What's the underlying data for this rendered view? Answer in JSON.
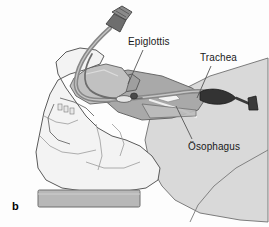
{
  "figure": {
    "panel_letter": "b",
    "type": "anatomical-illustration",
    "background_color": "#fdfdfd"
  },
  "labels": [
    {
      "id": "epiglottis",
      "text": "Epiglottis",
      "x": 128,
      "y": 36,
      "leader": {
        "x1": 143,
        "y1": 50,
        "x2": 128,
        "y2": 84
      }
    },
    {
      "id": "trachea",
      "text": "Trachea",
      "x": 200,
      "y": 52,
      "leader": {
        "x1": 211,
        "y1": 66,
        "x2": 197,
        "y2": 98
      }
    },
    {
      "id": "osophagus",
      "text": "Ösophagus",
      "x": 188,
      "y": 141,
      "leader": {
        "x1": 192,
        "y1": 139,
        "x2": 176,
        "y2": 106
      }
    }
  ],
  "palette": {
    "outline": "#4a4a4a",
    "skull_light": "#f2f2f2",
    "skull_shade": "#e2e2e2",
    "neck_fill": "#d9d9d9",
    "airway_mid": "#b0b0b0",
    "airway_dark": "#9a9a9a",
    "tongue": "#c4c4c4",
    "tube_gray": "#8a8a8a",
    "tube_dark": "#5d5d5d",
    "cuff_dark": "#3a3a3a",
    "base_block": "#b5b5b5",
    "leader_line": "#555555",
    "text": "#1a1a1a"
  },
  "anatomy_parts": [
    {
      "name": "skull-head-profile",
      "fill": "#f2f2f2"
    },
    {
      "name": "mandible-jaw",
      "fill": "#ececec"
    },
    {
      "name": "neck-soft-tissue",
      "fill": "#d9d9d9"
    },
    {
      "name": "tongue",
      "fill": "#c4c4c4"
    },
    {
      "name": "pharynx-airway",
      "fill": "#b0b0b0"
    },
    {
      "name": "trachea-lumen",
      "fill": "#9a9a9a"
    },
    {
      "name": "esophagus",
      "fill": "#a8a8a8"
    },
    {
      "name": "support-base-block",
      "fill": "#b5b5b5"
    }
  ],
  "device_parts": [
    {
      "name": "endotracheal-tube",
      "fill": "#8a8a8a"
    },
    {
      "name": "tube-connector-valve",
      "fill": "#6e6e6e"
    },
    {
      "name": "inflation-cuff-balloon",
      "fill": "#3a3a3a"
    },
    {
      "name": "pilot-balloon-connector",
      "fill": "#4a4a4a"
    },
    {
      "name": "laryngoscope-blade",
      "fill": "#c8c8c8"
    }
  ]
}
